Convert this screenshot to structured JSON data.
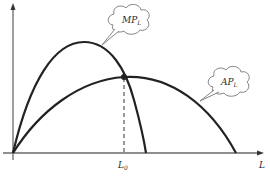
{
  "diagram": {
    "type": "economics-production-curves",
    "axes": {
      "x_label": "L",
      "y_label": ""
    },
    "curves": [
      {
        "name": "MP",
        "label": "MP",
        "subscript": "L",
        "description": "Marginal product of labour, rises then falls steeply, crossing AP at its maximum"
      },
      {
        "name": "AP",
        "label": "AP",
        "subscript": "L",
        "description": "Average product of labour, rises to a maximum then falls"
      }
    ],
    "marker": {
      "label": "L",
      "subscript": "0",
      "description": "Labour level where MP intersects AP (AP maximum), dashed vertical drop line"
    },
    "colors": {
      "curve": "#222222",
      "axis": "#555555",
      "cloud": "#777777"
    }
  }
}
